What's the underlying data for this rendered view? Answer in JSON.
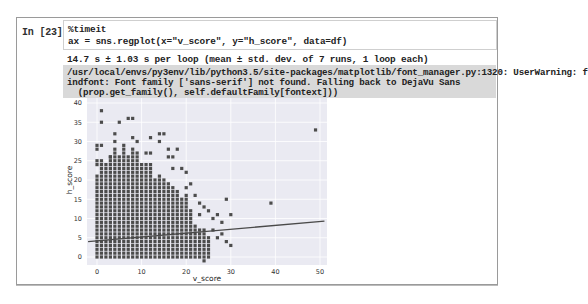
{
  "cell": {
    "prompt": "In [23]:",
    "code_lines": [
      "%timeit",
      "ax = sns.regplot(x=\"v_score\", y=\"h_score\", data=df)"
    ],
    "stdout": "14.7 s ± 1.03 s per loop (mean ± std. dev. of 7 runs, 1 loop each)",
    "stderr_lines": [
      "/usr/local/envs/py3env/lib/python3.5/site-packages/matplotlib/font_manager.py:1320: UserWarning: f",
      "indfont: Font family ['sans-serif'] not found. Falling back to DejaVu Sans",
      "  (prop.get_family(), self.defaultFamily[fontext]))"
    ]
  },
  "colors": {
    "axes_bg": "#eaeaf2",
    "grid": "#ffffff",
    "marker": "#4c4c4c",
    "regline": "#4a4a4a",
    "stderr_bg": "#d9d9d9"
  },
  "chart_data": {
    "type": "scatter",
    "title": "",
    "xlabel": "v_score",
    "ylabel": "h_score",
    "xlim": [
      -2,
      51
    ],
    "ylim": [
      -2,
      41
    ],
    "xticks": [
      0,
      10,
      20,
      30,
      40,
      50
    ],
    "yticks": [
      0,
      5,
      10,
      15,
      20,
      25,
      30,
      35,
      40
    ],
    "grid": true,
    "legend": null,
    "dense_columns": {
      "description": "for each integer v_score x, points exist at every integer h_score from 0 to top",
      "x": [
        0,
        1,
        2,
        3,
        4,
        5,
        6,
        7,
        8,
        9,
        10,
        11,
        12,
        13,
        14,
        15,
        16,
        17,
        18,
        19,
        20,
        21,
        22,
        23,
        24,
        25
      ],
      "top": [
        21,
        25,
        24,
        26,
        28,
        26,
        28,
        26,
        28,
        27,
        24,
        24,
        24,
        20,
        21,
        20,
        19,
        18,
        17,
        15,
        16,
        12,
        8,
        7,
        7,
        5
      ]
    },
    "sparse_points": [
      [
        0,
        24
      ],
      [
        0,
        25
      ],
      [
        0,
        28
      ],
      [
        0,
        29
      ],
      [
        1,
        38
      ],
      [
        1,
        35
      ],
      [
        1,
        29
      ],
      [
        3,
        26
      ],
      [
        4,
        32
      ],
      [
        4,
        30
      ],
      [
        5,
        35
      ],
      [
        6,
        29
      ],
      [
        7,
        36
      ],
      [
        8,
        36
      ],
      [
        8,
        31
      ],
      [
        9,
        30
      ],
      [
        11,
        27
      ],
      [
        12,
        31
      ],
      [
        12,
        27
      ],
      [
        14,
        32
      ],
      [
        14,
        30
      ],
      [
        15,
        32
      ],
      [
        16,
        28
      ],
      [
        16,
        26
      ],
      [
        17,
        26
      ],
      [
        17,
        23
      ],
      [
        18,
        28
      ],
      [
        19,
        23
      ],
      [
        20,
        22
      ],
      [
        20,
        18
      ],
      [
        21,
        19
      ],
      [
        22,
        16
      ],
      [
        23,
        14
      ],
      [
        23,
        11
      ],
      [
        24,
        13
      ],
      [
        24,
        -1
      ],
      [
        25,
        12
      ],
      [
        26,
        10
      ],
      [
        27,
        11
      ],
      [
        28,
        9
      ],
      [
        29,
        15
      ],
      [
        30,
        11
      ],
      [
        28,
        6
      ],
      [
        29,
        4
      ],
      [
        30,
        3
      ],
      [
        26,
        7
      ],
      [
        27,
        5
      ],
      [
        39,
        14
      ],
      [
        49,
        33
      ]
    ],
    "regression_line": {
      "x": [
        -2,
        51
      ],
      "y": [
        4.0,
        9.3
      ]
    }
  }
}
